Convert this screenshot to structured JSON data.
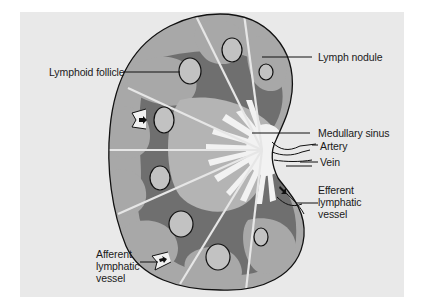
{
  "diagram": {
    "colors": {
      "background": "#e9e9e9",
      "outer_cortex": "#a8a8a8",
      "deep_cortex": "#6f6f6f",
      "follicle": "#bdbdbd",
      "medulla_sinus": "#f2f2f2",
      "outline": "#111111",
      "trabecula": "#e6e6e6"
    },
    "labels": {
      "lymphoid_follicle": "Lymphoid follicle",
      "lymph_nodule": "Lymph nodule",
      "medullary_sinus": "Medullary sinus",
      "artery": "Artery",
      "vein": "Vein",
      "efferent_lymphatic_vessel": "Efferent lymphatic vessel",
      "afferent_lymphatic_vessel": "Afferent lymphatic vessel"
    },
    "nodes": [
      {
        "id": "capsule",
        "label": "Lymph node capsule"
      },
      {
        "id": "follicle",
        "label": "Lymphoid follicle"
      },
      {
        "id": "nodule",
        "label": "Lymph nodule"
      },
      {
        "id": "sinus",
        "label": "Medullary sinus"
      },
      {
        "id": "artery",
        "label": "Artery"
      },
      {
        "id": "vein",
        "label": "Vein"
      },
      {
        "id": "afferent",
        "label": "Afferent lymphatic vessel"
      },
      {
        "id": "efferent",
        "label": "Efferent lymphatic vessel"
      }
    ],
    "edges": [
      {
        "from": "afferent",
        "to": "capsule",
        "kind": "lymph flow in"
      },
      {
        "from": "sinus",
        "to": "efferent",
        "kind": "lymph flow out"
      },
      {
        "from": "artery",
        "to": "sinus",
        "kind": "hilum vessel"
      },
      {
        "from": "vein",
        "to": "sinus",
        "kind": "hilum vessel"
      }
    ]
  }
}
